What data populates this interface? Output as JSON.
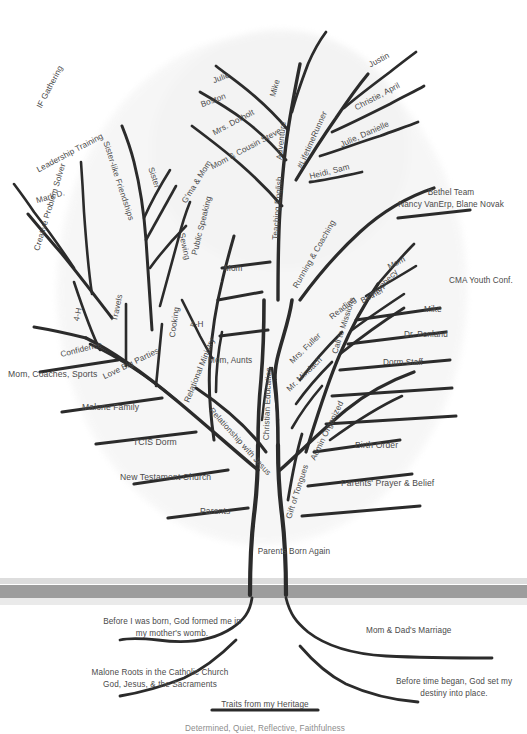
{
  "colors": {
    "branch": "#2b2b2b",
    "text": "#4a4a4a",
    "canopy": "#ededed",
    "ground": "#9d9d9d",
    "background": "#ffffff"
  },
  "canopy": {
    "left_cluster": {
      "label": "Leadership Training",
      "items": [
        {
          "label": "IF Gathering"
        },
        {
          "label": "Mark D."
        }
      ]
    },
    "sister_cluster": {
      "label": "Sister-like Friendships",
      "items": [
        {
          "label": "Sister"
        },
        {
          "label": "Sewing"
        },
        {
          "label": "G'ma & Mom"
        }
      ]
    },
    "confidence_cluster": {
      "label": "Confidence",
      "items": [
        {
          "label": "Creative Problem Solver"
        },
        {
          "label": "4-H"
        },
        {
          "label": "Travels"
        },
        {
          "label": "Mom, Coaches, Sports"
        }
      ]
    },
    "love_parties_cluster": {
      "label": "Love Big Parties",
      "items": [
        {
          "label": "Public Speaking"
        },
        {
          "label": "Cooking"
        },
        {
          "label": "Mom"
        },
        {
          "label": "4-H"
        },
        {
          "label": "Mom, Aunts"
        },
        {
          "label": "Malone Family"
        }
      ]
    },
    "relational_ministry": {
      "label": "Relational Ministry",
      "items": [
        {
          "label": "TCIS Dorm"
        },
        {
          "label": "New Testament Church"
        },
        {
          "label": "Parents"
        }
      ]
    },
    "adventure_cluster": {
      "label": "Adventure",
      "items": [
        {
          "label": "Julie"
        },
        {
          "label": "Boston"
        },
        {
          "label": "Mike"
        },
        {
          "label": "Mrs. Dorholt"
        },
        {
          "label": "Mom & Cousin Steve"
        }
      ]
    },
    "teaching_english": {
      "label": "Teaching English"
    },
    "lifetime_runner": {
      "label": "#LifetimeRunner",
      "items": [
        {
          "label": "Justin"
        },
        {
          "label": "Christie, April"
        },
        {
          "label": "Julie, Danielle"
        },
        {
          "label": "Heidi, Sam"
        }
      ]
    },
    "running_coaching": {
      "label": "Running & Coaching",
      "items": [
        {
          "label": "Bethel Team"
        },
        {
          "label": "Nancy VanErp, Blane Novak"
        }
      ]
    },
    "call_to_missions": {
      "label": "Call to Missions",
      "items": [
        {
          "label": "Mom"
        },
        {
          "label": "Bethel"
        },
        {
          "label": "Prophecy"
        },
        {
          "label": "CMA Youth Conf."
        },
        {
          "label": "Mike"
        },
        {
          "label": "Dr. Penland"
        },
        {
          "label": "Dorm Staff"
        }
      ]
    },
    "reading_cluster": {
      "label": "Reading",
      "items": [
        {
          "label": "Mrs. Fuller"
        },
        {
          "label": "Mr. Mindach"
        }
      ]
    },
    "admin_organized": {
      "label": "Admin Organized",
      "items": [
        {
          "label": "Birth Order"
        },
        {
          "label": "Parents' Prayer & Belief"
        }
      ]
    },
    "gift_of_tongues": {
      "label": "Gift of Tongues"
    },
    "christian_education": {
      "label": "Christian Education"
    },
    "relationship_with_jesus": {
      "label": "Relationship with Jesus"
    },
    "parents_born_again": {
      "label": "Parents Born Again"
    }
  },
  "roots": [
    {
      "id": "root-womb",
      "line1": "Before I was born, God formed me in",
      "line2": "my mother's womb."
    },
    {
      "id": "root-marriage",
      "line1": "Mom & Dad's Marriage",
      "line2": ""
    },
    {
      "id": "root-catholic",
      "line1": "Malone Roots in the Catholic Church",
      "line2": "God, Jesus, & the Sacraments"
    },
    {
      "id": "root-destiny",
      "line1": "Before time began, God set my",
      "line2": "destiny into place."
    },
    {
      "id": "root-heritage",
      "line1": "Traits from my Heritage",
      "line2": ""
    },
    {
      "id": "root-traits",
      "line1": "Determined, Quiet, Reflective, Faithfulness",
      "line2": ""
    }
  ]
}
